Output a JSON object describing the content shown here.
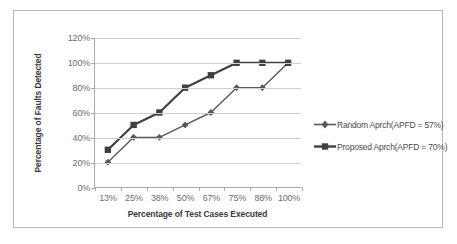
{
  "chart_data": {
    "type": "line",
    "title": "",
    "xlabel": "Percentage of Test Cases Executed",
    "ylabel": "Percentage of Faults Detected",
    "categories": [
      "13%",
      "25%",
      "38%",
      "50%",
      "67%",
      "75%",
      "88%",
      "100%"
    ],
    "ytick_labels": [
      "0%",
      "20%",
      "40%",
      "60%",
      "80%",
      "100%",
      "120%"
    ],
    "ytick_values": [
      0,
      20,
      40,
      60,
      80,
      100,
      120
    ],
    "ylim": [
      0,
      120
    ],
    "grid": true,
    "legend_position": "right",
    "series": [
      {
        "name": "Random Aprch(APFD = 57%)",
        "values": [
          20,
          40,
          40,
          50,
          60,
          80,
          80,
          100
        ],
        "color": "#595959",
        "marker": "diamond",
        "line_width": 1.4
      },
      {
        "name": "Proposed Aprch(APFD = 70%)",
        "values": [
          30,
          50,
          60,
          80,
          90,
          100,
          100,
          100
        ],
        "color": "#404040",
        "marker": "square",
        "line_width": 2.2
      }
    ]
  },
  "frame": {
    "border_color": "#b8b8b8",
    "background": "#ffffff"
  },
  "axis": {
    "line_color": "#aaaaaa",
    "grid_color": "#cfcfcf",
    "tick_label_color": "#6e6e6e",
    "title_color": "#3a3a3a"
  }
}
